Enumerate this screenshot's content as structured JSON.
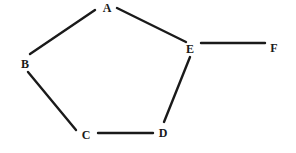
{
  "diagram": {
    "type": "undirected-graph",
    "background": "#ffffff",
    "stroke_color": "#1a1a1a",
    "nodes": [
      {
        "id": "A",
        "label": "A",
        "x": 107,
        "y": 12
      },
      {
        "id": "B",
        "label": "B",
        "x": 25,
        "y": 68
      },
      {
        "id": "C",
        "label": "C",
        "x": 86,
        "y": 139
      },
      {
        "id": "D",
        "label": "D",
        "x": 163,
        "y": 137
      },
      {
        "id": "E",
        "label": "E",
        "x": 190,
        "y": 53
      },
      {
        "id": "F",
        "label": "F",
        "x": 274,
        "y": 52
      }
    ],
    "edges": [
      {
        "from": "A",
        "to": "B",
        "x1": 95,
        "y1": 10,
        "x2": 30,
        "y2": 54
      },
      {
        "from": "A",
        "to": "E",
        "x1": 117,
        "y1": 8,
        "x2": 186,
        "y2": 42
      },
      {
        "from": "B",
        "to": "C",
        "x1": 28,
        "y1": 72,
        "x2": 76,
        "y2": 130
      },
      {
        "from": "C",
        "to": "D",
        "x1": 98,
        "y1": 133,
        "x2": 153,
        "y2": 133
      },
      {
        "from": "D",
        "to": "E",
        "x1": 164,
        "y1": 122,
        "x2": 190,
        "y2": 57
      },
      {
        "from": "E",
        "to": "F",
        "x1": 201,
        "y1": 43,
        "x2": 265,
        "y2": 43
      }
    ]
  }
}
